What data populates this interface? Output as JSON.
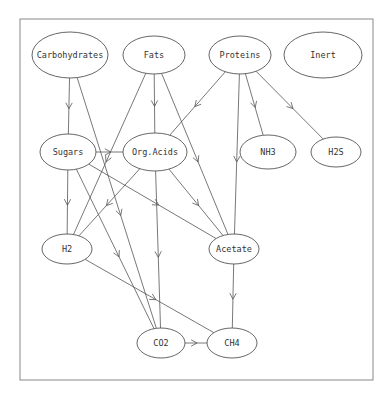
{
  "diagram": {
    "title": "",
    "frame": {
      "x": 20,
      "y": 19,
      "w": 353,
      "h": 361
    },
    "nodes": [
      {
        "id": "carbohydrates",
        "label": "Carbohydrates",
        "cx": 70,
        "cy": 55,
        "rx": 38,
        "ry": 23
      },
      {
        "id": "fats",
        "label": "Fats",
        "cx": 154,
        "cy": 55,
        "rx": 31,
        "ry": 19
      },
      {
        "id": "proteins",
        "label": "Proteins",
        "cx": 240,
        "cy": 55,
        "rx": 31,
        "ry": 19
      },
      {
        "id": "inert",
        "label": "Inert",
        "cx": 323,
        "cy": 55,
        "rx": 39,
        "ry": 23
      },
      {
        "id": "sugars",
        "label": "Sugars",
        "cx": 68,
        "cy": 152,
        "rx": 28,
        "ry": 18
      },
      {
        "id": "org_acids",
        "label": "Org.Acids",
        "cx": 155,
        "cy": 152,
        "rx": 32,
        "ry": 19
      },
      {
        "id": "nh3",
        "label": "NH3",
        "cx": 268,
        "cy": 152,
        "rx": 28,
        "ry": 17
      },
      {
        "id": "h2s",
        "label": "H2S",
        "cx": 336,
        "cy": 152,
        "rx": 25,
        "ry": 15
      },
      {
        "id": "h2",
        "label": "H2",
        "cx": 67,
        "cy": 249,
        "rx": 25,
        "ry": 15
      },
      {
        "id": "acetate",
        "label": "Acetate",
        "cx": 234,
        "cy": 249,
        "rx": 25,
        "ry": 15
      },
      {
        "id": "co2",
        "label": "CO2",
        "cx": 161,
        "cy": 343,
        "rx": 24,
        "ry": 15
      },
      {
        "id": "ch4",
        "label": "CH4",
        "cx": 232,
        "cy": 343,
        "rx": 25,
        "ry": 15
      }
    ],
    "edges": [
      {
        "from": "carbohydrates",
        "to": "sugars"
      },
      {
        "from": "carbohydrates",
        "to": "co2"
      },
      {
        "from": "fats",
        "to": "org_acids"
      },
      {
        "from": "fats",
        "to": "h2"
      },
      {
        "from": "fats",
        "to": "acetate"
      },
      {
        "from": "proteins",
        "to": "org_acids"
      },
      {
        "from": "proteins",
        "to": "acetate"
      },
      {
        "from": "proteins",
        "to": "nh3"
      },
      {
        "from": "proteins",
        "to": "h2s"
      },
      {
        "from": "sugars",
        "to": "org_acids"
      },
      {
        "from": "sugars",
        "to": "h2"
      },
      {
        "from": "sugars",
        "to": "co2"
      },
      {
        "from": "sugars",
        "to": "acetate"
      },
      {
        "from": "org_acids",
        "to": "h2"
      },
      {
        "from": "org_acids",
        "to": "co2"
      },
      {
        "from": "org_acids",
        "to": "acetate"
      },
      {
        "from": "h2",
        "to": "ch4"
      },
      {
        "from": "acetate",
        "to": "ch4"
      },
      {
        "from": "co2",
        "to": "ch4"
      }
    ]
  }
}
